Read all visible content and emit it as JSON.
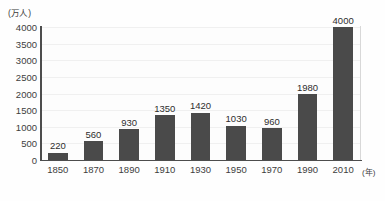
{
  "chart_data": {
    "type": "bar",
    "title": "",
    "subtitle": "",
    "xlabel": "(年)",
    "ylabel": "(万人)",
    "categories": [
      "1850",
      "1870",
      "1890",
      "1910",
      "1930",
      "1950",
      "1970",
      "1990",
      "2010"
    ],
    "values": [
      220,
      560,
      930,
      1350,
      1420,
      1030,
      960,
      1980,
      4000
    ],
    "value_labels": [
      "220",
      "560",
      "930",
      "1350",
      "1420",
      "1030",
      "960",
      "1980",
      "4000"
    ],
    "ylim": [
      0,
      4000
    ],
    "ytick_labels": [
      "0",
      "500",
      "1000",
      "1500",
      "2000",
      "2500",
      "3000",
      "3500",
      "4000"
    ],
    "ytick_values": [
      0,
      500,
      1000,
      1500,
      2000,
      2500,
      3000,
      3500,
      4000
    ],
    "grid": true,
    "legend": "none",
    "bar_color": "#4a4a4a",
    "axis_color": "#4d4d4d",
    "grid_color": "#f0f0f0",
    "background_color": "#ffffff"
  }
}
